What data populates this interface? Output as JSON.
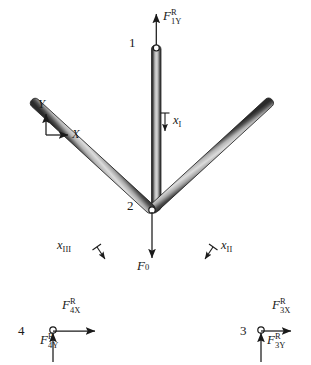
{
  "figure": {
    "type": "three-bar-truss-free-body-diagram",
    "background": "#ffffff",
    "bar_color_edge": "#2b2b2b",
    "bar_color_core": "#c9c9c9",
    "text_color": "#1a1a1a"
  },
  "axes": {
    "x_label": "X",
    "y_label": "Y"
  },
  "nodes": [
    {
      "id": "1",
      "label": "1",
      "x": 157,
      "y": 45
    },
    {
      "id": "2",
      "label": "2",
      "x": 152,
      "y": 210
    },
    {
      "id": "3",
      "label": "3",
      "x": 262,
      "y": 330
    },
    {
      "id": "4",
      "label": "4",
      "x": 52,
      "y": 330
    }
  ],
  "members": [
    {
      "id": "I",
      "label": "x",
      "roman": "I",
      "from": "1",
      "to": "2"
    },
    {
      "id": "II",
      "label": "x",
      "roman": "II",
      "from": "2",
      "to": "3"
    },
    {
      "id": "III",
      "label": "x",
      "roman": "III",
      "from": "2",
      "to": "4"
    }
  ],
  "forces": [
    {
      "id": "F1Y",
      "symbol": "F",
      "sub": "1Y",
      "sup": "R",
      "direction": "up",
      "at_node": "1"
    },
    {
      "id": "F0",
      "symbol": "F",
      "sub": "0",
      "sup": "",
      "direction": "down",
      "at_node": "2"
    },
    {
      "id": "F3X",
      "symbol": "F",
      "sub": "3X",
      "sup": "R",
      "direction": "right",
      "at_node": "3"
    },
    {
      "id": "F3Y",
      "symbol": "F",
      "sub": "3Y",
      "sup": "R",
      "direction": "up",
      "at_node": "3"
    },
    {
      "id": "F4X",
      "symbol": "F",
      "sub": "4X",
      "sup": "R",
      "direction": "right",
      "at_node": "4"
    },
    {
      "id": "F4Y",
      "symbol": "F",
      "sub": "4Y",
      "sup": "R",
      "direction": "up",
      "at_node": "4"
    }
  ]
}
